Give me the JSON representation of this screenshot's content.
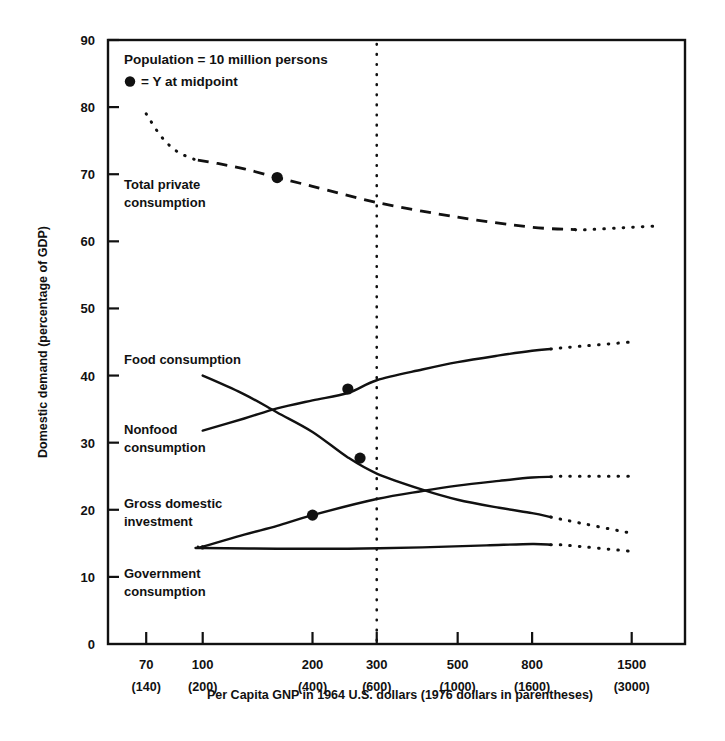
{
  "chart_data": {
    "type": "line",
    "title": "",
    "xlabel": "Per Capita GNP in 1964 U.S. dollars (1976 dollars in parentheses)",
    "ylabel": "Domestic demand (percentage of GDP)",
    "xscale": "log",
    "xlim": [
      55,
      2100
    ],
    "ylim": [
      0,
      90
    ],
    "ytick_values": [
      0,
      10,
      20,
      30,
      40,
      50,
      60,
      70,
      80,
      90
    ],
    "ytick_labels": [
      "0",
      "10",
      "20",
      "30",
      "40",
      "50",
      "60",
      "70",
      "80",
      "90"
    ],
    "xtick_values": [
      70,
      100,
      200,
      300,
      500,
      800,
      1500
    ],
    "xtick_labels": [
      "70",
      "100",
      "200",
      "300",
      "500",
      "800",
      "1500"
    ],
    "xtick_labels_secondary": [
      "(140)",
      "(200)",
      "(400)",
      "(600)",
      "(1000)",
      "(1600)",
      "(3000)"
    ],
    "grid": false,
    "legend_position": "upper-left-inside",
    "annotations": [
      "Population = 10 million persons",
      "= Y at midpoint"
    ],
    "reference_line_x": 300,
    "series": [
      {
        "name": "Total private consumption",
        "style": "dashed",
        "label_x": 100,
        "label_y": 66,
        "points": [
          {
            "x": 70,
            "y": 79.0
          },
          {
            "x": 77,
            "y": 75.6
          },
          {
            "x": 85,
            "y": 73.4
          },
          {
            "x": 95,
            "y": 72.2
          },
          {
            "x": 110,
            "y": 71.6
          },
          {
            "x": 130,
            "y": 70.8
          },
          {
            "x": 160,
            "y": 69.5
          },
          {
            "x": 200,
            "y": 68.2
          },
          {
            "x": 300,
            "y": 65.8
          },
          {
            "x": 500,
            "y": 63.6
          },
          {
            "x": 800,
            "y": 62.1
          },
          {
            "x": 1100,
            "y": 61.7
          },
          {
            "x": 1500,
            "y": 62.1
          },
          {
            "x": 1800,
            "y": 62.3
          }
        ],
        "dotted_from_x": 1050,
        "dotted_before_x": 97,
        "midpoint": {
          "x": 160,
          "y": 69.5
        }
      },
      {
        "name": "Food consumption",
        "style": "solid",
        "label_x": 85,
        "label_y": 42.5,
        "points": [
          {
            "x": 100,
            "y": 31.8
          },
          {
            "x": 130,
            "y": 33.6
          },
          {
            "x": 160,
            "y": 35.1
          },
          {
            "x": 200,
            "y": 36.3
          },
          {
            "x": 250,
            "y": 37.4
          },
          {
            "x": 300,
            "y": 39.3
          },
          {
            "x": 400,
            "y": 40.9
          },
          {
            "x": 500,
            "y": 42.0
          },
          {
            "x": 650,
            "y": 43.0
          },
          {
            "x": 800,
            "y": 43.7
          },
          {
            "x": 1000,
            "y": 44.2
          },
          {
            "x": 1500,
            "y": 45.0
          }
        ],
        "dotted_from_x": 900,
        "midpoint": {
          "x": 250,
          "y": 38.0
        }
      },
      {
        "name": "Nonfood consumption",
        "style": "solid",
        "label_x": 82,
        "label_y": 30.5,
        "points": [
          {
            "x": 100,
            "y": 40.0
          },
          {
            "x": 130,
            "y": 37.2
          },
          {
            "x": 160,
            "y": 34.5
          },
          {
            "x": 200,
            "y": 31.6
          },
          {
            "x": 250,
            "y": 27.8
          },
          {
            "x": 300,
            "y": 25.4
          },
          {
            "x": 400,
            "y": 23.0
          },
          {
            "x": 500,
            "y": 21.5
          },
          {
            "x": 650,
            "y": 20.3
          },
          {
            "x": 800,
            "y": 19.5
          },
          {
            "x": 1000,
            "y": 18.4
          },
          {
            "x": 1500,
            "y": 16.5
          }
        ],
        "dotted_from_x": 900,
        "midpoint": {
          "x": 270,
          "y": 27.7
        }
      },
      {
        "name": "Gross domestic investment",
        "style": "solid",
        "label_x": 85,
        "label_y": 21.5,
        "points": [
          {
            "x": 100,
            "y": 14.5
          },
          {
            "x": 130,
            "y": 16.3
          },
          {
            "x": 160,
            "y": 17.6
          },
          {
            "x": 200,
            "y": 19.2
          },
          {
            "x": 300,
            "y": 21.6
          },
          {
            "x": 400,
            "y": 22.8
          },
          {
            "x": 500,
            "y": 23.6
          },
          {
            "x": 650,
            "y": 24.3
          },
          {
            "x": 800,
            "y": 24.8
          },
          {
            "x": 1000,
            "y": 25.0
          },
          {
            "x": 1500,
            "y": 25.0
          }
        ],
        "dotted_from_x": 900,
        "dotted_before_x": 97,
        "midpoint": {
          "x": 200,
          "y": 19.2
        }
      },
      {
        "name": "Government consumption",
        "style": "solid",
        "label_x": 85,
        "label_y": 9.8,
        "points": [
          {
            "x": 100,
            "y": 14.3
          },
          {
            "x": 160,
            "y": 14.2
          },
          {
            "x": 250,
            "y": 14.2
          },
          {
            "x": 400,
            "y": 14.4
          },
          {
            "x": 600,
            "y": 14.7
          },
          {
            "x": 800,
            "y": 14.9
          },
          {
            "x": 1000,
            "y": 14.7
          },
          {
            "x": 1500,
            "y": 13.8
          }
        ],
        "dotted_from_x": 900,
        "dotted_before_x": 97,
        "midpoint": null
      }
    ]
  },
  "labels": {
    "ylabel": "Domestic demand (percentage of GDP)",
    "xlabel": "Per Capita GNP in 1964 U.S. dollars (1976 dollars in parentheses)",
    "legend_line_1": "Population = 10 million persons",
    "legend_line_2": "= Y at midpoint",
    "series_total_private": "Total private",
    "series_total_private_2": "consumption",
    "series_food": "Food consumption",
    "series_nonfood": "Nonfood",
    "series_nonfood_2": "consumption",
    "series_investment": "Gross domestic",
    "series_investment_2": "investment",
    "series_government": "Government",
    "series_government_2": "consumption"
  }
}
